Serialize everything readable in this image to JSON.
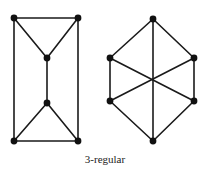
{
  "caption": "3-regular",
  "colors": {
    "edge": "#1a1a1a",
    "vertex": "#111111",
    "background": "#ffffff"
  },
  "graphs": [
    {
      "name": "left-graph",
      "vertices": [
        {
          "id": "a",
          "x": 14,
          "y": 18
        },
        {
          "id": "b",
          "x": 78,
          "y": 18
        },
        {
          "id": "c",
          "x": 47,
          "y": 58
        },
        {
          "id": "d",
          "x": 47,
          "y": 103
        },
        {
          "id": "e",
          "x": 14,
          "y": 141
        },
        {
          "id": "f",
          "x": 78,
          "y": 141
        }
      ],
      "edges": [
        [
          "a",
          "b"
        ],
        [
          "a",
          "e"
        ],
        [
          "b",
          "f"
        ],
        [
          "e",
          "f"
        ],
        [
          "a",
          "c"
        ],
        [
          "b",
          "c"
        ],
        [
          "c",
          "d"
        ],
        [
          "d",
          "e"
        ],
        [
          "d",
          "f"
        ]
      ]
    },
    {
      "name": "right-graph",
      "vertices": [
        {
          "id": "t",
          "x": 153,
          "y": 19
        },
        {
          "id": "ul",
          "x": 110,
          "y": 58
        },
        {
          "id": "ur",
          "x": 194,
          "y": 58
        },
        {
          "id": "ll",
          "x": 110,
          "y": 101
        },
        {
          "id": "lr",
          "x": 194,
          "y": 101
        },
        {
          "id": "bt",
          "x": 153,
          "y": 141
        }
      ],
      "edges": [
        [
          "t",
          "ul"
        ],
        [
          "t",
          "ur"
        ],
        [
          "ul",
          "ll"
        ],
        [
          "ur",
          "lr"
        ],
        [
          "ll",
          "bt"
        ],
        [
          "lr",
          "bt"
        ],
        [
          "t",
          "bt"
        ],
        [
          "ul",
          "lr"
        ],
        [
          "ur",
          "ll"
        ]
      ]
    }
  ]
}
